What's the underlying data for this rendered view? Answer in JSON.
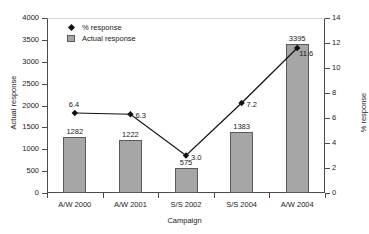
{
  "chart_data": {
    "type": "bar",
    "title": "",
    "xlabel": "Campaign",
    "ylabel": "Actual response",
    "y2label": "% response",
    "categories": [
      "A/W 2000",
      "A/W 2001",
      "S/S 2002",
      "S/S 2004",
      "A/W 2004"
    ],
    "series": [
      {
        "name": "Actual response",
        "type": "bar",
        "axis": "left",
        "values": [
          1282,
          1222,
          575,
          1383,
          3395
        ],
        "labels": [
          "1282",
          "1222",
          "575",
          "1383",
          "3395"
        ],
        "color": "#a6a6a6",
        "border_color": "#5a5a5a"
      },
      {
        "name": "% response",
        "type": "line",
        "axis": "right",
        "values": [
          6.4,
          6.3,
          3.0,
          7.2,
          11.6
        ],
        "labels": [
          "6.4",
          "6.3",
          "3.0",
          "7.2",
          "11.6"
        ],
        "color": "#111111",
        "marker": "diamond"
      }
    ],
    "ylim": [
      0,
      4000
    ],
    "yticks": [
      0,
      500,
      1000,
      1500,
      2000,
      2500,
      3000,
      3500,
      4000
    ],
    "ytick_labels": [
      "0",
      "500",
      "1000",
      "1500",
      "2000",
      "2500",
      "3000",
      "3500",
      "4000"
    ],
    "y2lim": [
      0,
      14
    ],
    "y2ticks": [
      0,
      2,
      4,
      6,
      8,
      10,
      12,
      14
    ],
    "y2tick_labels": [
      "0",
      "2",
      "4",
      "6",
      "8",
      "10",
      "12",
      "14"
    ],
    "grid": false,
    "legend_position": "top-left",
    "legend_entries": [
      "% response",
      "Actual response"
    ]
  }
}
